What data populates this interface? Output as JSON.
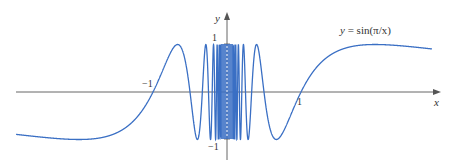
{
  "chart_data": {
    "type": "line",
    "title": "",
    "function": "y = sin(π/x)",
    "annotation": "y = sin(π/x)",
    "xlabel": "x",
    "ylabel": "y",
    "x_ticks": [
      {
        "value": -1,
        "label": "−1"
      },
      {
        "value": 1,
        "label": "1"
      }
    ],
    "y_ticks": [
      {
        "value": 1,
        "label": "1"
      },
      {
        "value": -1,
        "label": "−1"
      }
    ],
    "xlim": [
      -2.85,
      2.85
    ],
    "ylim": [
      -1.4,
      1.65
    ],
    "grid": false,
    "legend": null,
    "series": [
      {
        "name": "sin(π/x)",
        "color": "#3a6fc4",
        "x_range": [
          -2.85,
          2.77
        ],
        "sample_points": [
          {
            "x": -2.85,
            "y": -0.9
          },
          {
            "x": -2.0,
            "y": -1.0
          },
          {
            "x": -1.5,
            "y": -0.87
          },
          {
            "x": -1.0,
            "y": 0.0
          },
          {
            "x": -0.667,
            "y": 1.0
          },
          {
            "x": -0.5,
            "y": 0.0
          },
          {
            "x": -0.4,
            "y": -1.0
          },
          {
            "x": 0.4,
            "y": 1.0
          },
          {
            "x": 0.5,
            "y": 0.0
          },
          {
            "x": 0.667,
            "y": -1.0
          },
          {
            "x": 1.0,
            "y": 0.0
          },
          {
            "x": 1.5,
            "y": 0.87
          },
          {
            "x": 2.0,
            "y": 1.0
          },
          {
            "x": 2.77,
            "y": 0.88
          }
        ]
      }
    ],
    "colors": {
      "curve": "#3a6fc4",
      "axis": "#555555",
      "text": "#333333"
    }
  },
  "labels": {
    "x_axis": "x",
    "y_axis": "y",
    "tick_neg1_x": "−1",
    "tick_pos1_x": "1",
    "tick_pos1_y": "1",
    "tick_neg1_y": "−1",
    "equation_prefix": "y",
    "equation_body": " = sin(π/x)"
  }
}
